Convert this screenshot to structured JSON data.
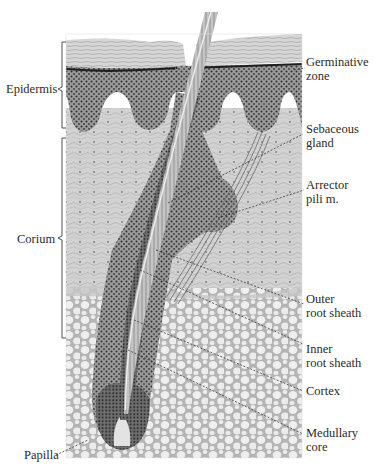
{
  "figure": {
    "type": "anatomical-illustration",
    "caption_fragment": "",
    "colors": {
      "background": "#ffffff",
      "stratum_corneum": "#cfcfcf",
      "epidermis_dots": "#3a3a3a",
      "epidermis_fill": "#8c8c8c",
      "dermis": "#c9c9c9",
      "fat": "#b3b3b3",
      "fat_cells": "#ececec",
      "hair_shaft": "#bdbdbd",
      "leader_line": "#3a3a3a"
    }
  },
  "labels": {
    "left": {
      "epidermis": "Epidermis",
      "corium": "Corium",
      "papilla": "Papilla"
    },
    "right": {
      "germinative_1": "Germinative",
      "germinative_2": "zone",
      "sebaceous_1": "Sebaceous",
      "sebaceous_2": "gland",
      "arrector_1": "Arrector",
      "arrector_2": "pili m.",
      "outer_1": "Outer",
      "outer_2": "root sheath",
      "inner_1": "Inner",
      "inner_2": "root sheath",
      "cortex": "Cortex",
      "medullary_1": "Medullary",
      "medullary_2": "core"
    }
  }
}
